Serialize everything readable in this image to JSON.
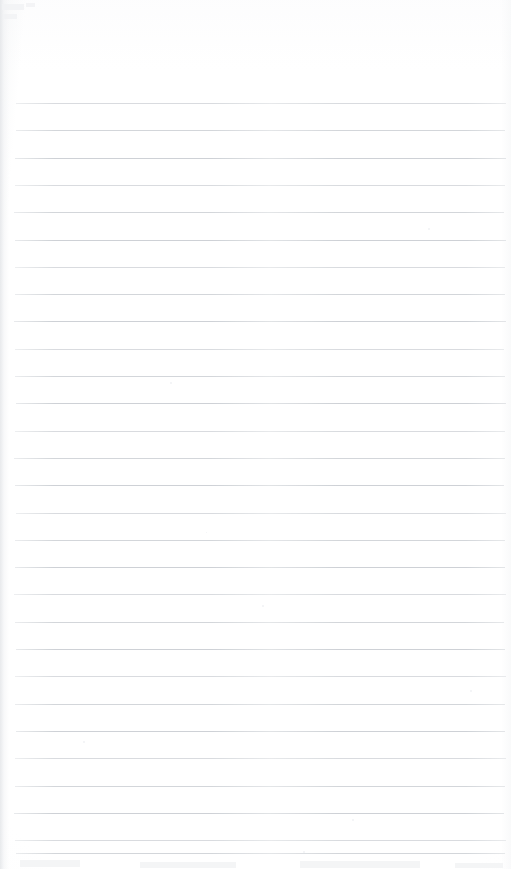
{
  "document": {
    "kind": "scanned-blank-ruled-notebook-page",
    "title": "",
    "page_text": "",
    "handwriting": "",
    "printed_text": "",
    "page_number": "",
    "width_px": 511,
    "height_px": 869
  },
  "page": {
    "background_color": "#ffffff",
    "paper_tint_color": "#fcfcfd",
    "left_edge_shadow_color": "#e4e6e9",
    "right_edge_shadow_color": "#f7f8f9"
  },
  "ruling": {
    "line_color": "#c9cdd2",
    "line_thickness_px": 1,
    "line_spacing_px": 27.3,
    "first_line_y_px": 103,
    "last_line_y_px": 853,
    "line_start_x_px": 15,
    "line_end_x_px": 505,
    "line_count": 29,
    "top_margin_px": 103,
    "bottom_margin_px": 16,
    "lines_y": [
      103.0,
      130.3,
      157.6,
      184.9,
      212.2,
      239.5,
      266.8,
      294.1,
      321.4,
      348.7,
      376.0,
      403.3,
      430.6,
      457.9,
      485.2,
      512.5,
      539.8,
      567.1,
      594.4,
      621.7,
      649.0,
      676.3,
      703.6,
      730.9,
      758.2,
      785.5,
      812.8,
      840.1,
      853.0
    ],
    "line_inset_left": [
      16,
      16,
      15,
      15,
      14,
      15,
      15,
      15,
      14,
      15,
      15,
      16,
      15,
      14,
      15,
      16,
      15,
      15,
      14,
      15,
      16,
      15,
      15,
      16,
      15,
      15,
      14,
      15,
      16
    ],
    "line_inset_right": [
      506,
      505,
      506,
      505,
      504,
      506,
      505,
      505,
      506,
      504,
      505,
      506,
      505,
      505,
      504,
      506,
      505,
      505,
      506,
      504,
      505,
      506,
      505,
      505,
      506,
      505,
      504,
      506,
      505
    ]
  },
  "artifacts": {
    "specks": [
      {
        "x": 170,
        "y": 382,
        "size": 2
      },
      {
        "x": 262,
        "y": 605,
        "size": 2
      },
      {
        "x": 352,
        "y": 819,
        "size": 2
      },
      {
        "x": 83,
        "y": 741,
        "size": 2
      },
      {
        "x": 303,
        "y": 851,
        "size": 2
      },
      {
        "x": 428,
        "y": 228,
        "size": 2
      },
      {
        "x": 206,
        "y": 532,
        "size": 1
      },
      {
        "x": 470,
        "y": 690,
        "size": 2
      }
    ],
    "smudges": [
      {
        "x": 2,
        "y": 4,
        "w": 22,
        "h": 6
      },
      {
        "x": 3,
        "y": 14,
        "w": 14,
        "h": 5
      },
      {
        "x": 26,
        "y": 3,
        "w": 9,
        "h": 4
      },
      {
        "x": 20,
        "y": 860,
        "w": 60,
        "h": 7
      },
      {
        "x": 140,
        "y": 862,
        "w": 96,
        "h": 6
      },
      {
        "x": 300,
        "y": 861,
        "w": 120,
        "h": 7
      },
      {
        "x": 455,
        "y": 863,
        "w": 48,
        "h": 5
      }
    ]
  }
}
